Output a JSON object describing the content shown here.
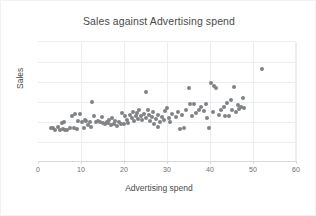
{
  "chart_data": {
    "type": "scatter",
    "title": "Sales against Advertising spend",
    "xlabel": "Advertising spend",
    "ylabel": "Sales",
    "xlim": [
      0,
      60
    ],
    "ylim": [
      0,
      6
    ],
    "xticks": [
      0,
      10,
      20,
      30,
      40,
      50,
      60
    ],
    "yticks": [],
    "grid": true,
    "legend": false,
    "marker_color": "#808285",
    "series": [
      {
        "name": "Sales",
        "points": [
          [
            3.0,
            1.68
          ],
          [
            3.4,
            1.7
          ],
          [
            4.0,
            1.62
          ],
          [
            4.6,
            1.75
          ],
          [
            5.2,
            1.6
          ],
          [
            5.5,
            1.95
          ],
          [
            5.8,
            1.66
          ],
          [
            6.0,
            2.02
          ],
          [
            6.3,
            1.58
          ],
          [
            6.8,
            1.62
          ],
          [
            7.4,
            1.68
          ],
          [
            7.8,
            2.3
          ],
          [
            8.3,
            1.72
          ],
          [
            8.6,
            2.38
          ],
          [
            9.0,
            1.66
          ],
          [
            9.4,
            2.05
          ],
          [
            9.8,
            2.42
          ],
          [
            10.2,
            2.0
          ],
          [
            10.6,
            1.7
          ],
          [
            10.9,
            2.12
          ],
          [
            11.2,
            2.06
          ],
          [
            11.6,
            1.84
          ],
          [
            12.0,
            2.02
          ],
          [
            12.3,
            1.74
          ],
          [
            12.6,
            3.02
          ],
          [
            13.0,
            2.3
          ],
          [
            13.4,
            2.0
          ],
          [
            14.0,
            2.06
          ],
          [
            14.4,
            1.98
          ],
          [
            14.8,
            2.24
          ],
          [
            15.2,
            1.96
          ],
          [
            15.6,
            1.88
          ],
          [
            16.0,
            2.02
          ],
          [
            16.3,
            1.94
          ],
          [
            16.6,
            2.08
          ],
          [
            17.0,
            1.86
          ],
          [
            17.3,
            2.22
          ],
          [
            17.6,
            1.9
          ],
          [
            18.0,
            2.04
          ],
          [
            18.4,
            1.82
          ],
          [
            18.8,
            2.0
          ],
          [
            19.2,
            1.92
          ],
          [
            19.6,
            2.46
          ],
          [
            20.0,
            1.88
          ],
          [
            20.3,
            2.3
          ],
          [
            20.6,
            2.1
          ],
          [
            21.0,
            1.96
          ],
          [
            21.4,
            2.34
          ],
          [
            21.8,
            2.18
          ],
          [
            22.0,
            2.5
          ],
          [
            22.4,
            2.06
          ],
          [
            22.8,
            2.28
          ],
          [
            23.0,
            2.44
          ],
          [
            23.3,
            2.16
          ],
          [
            23.6,
            2.58
          ],
          [
            24.0,
            2.3
          ],
          [
            24.3,
            2.12
          ],
          [
            24.6,
            2.4
          ],
          [
            25.0,
            3.52
          ],
          [
            25.2,
            2.2
          ],
          [
            25.5,
            2.62
          ],
          [
            25.8,
            2.34
          ],
          [
            26.0,
            2.06
          ],
          [
            26.4,
            2.26
          ],
          [
            26.8,
            2.48
          ],
          [
            27.0,
            1.92
          ],
          [
            27.4,
            2.14
          ],
          [
            27.8,
            1.74
          ],
          [
            28.0,
            2.36
          ],
          [
            28.4,
            2.02
          ],
          [
            28.8,
            2.26
          ],
          [
            29.2,
            2.08
          ],
          [
            29.6,
            2.54
          ],
          [
            30.0,
            2.68
          ],
          [
            30.4,
            2.2
          ],
          [
            30.8,
            2.02
          ],
          [
            31.2,
            2.4
          ],
          [
            32.0,
            2.24
          ],
          [
            32.6,
            2.5
          ],
          [
            33.0,
            1.66
          ],
          [
            33.4,
            2.34
          ],
          [
            34.0,
            1.7
          ],
          [
            34.4,
            2.62
          ],
          [
            35.0,
            3.72
          ],
          [
            35.4,
            2.88
          ],
          [
            35.8,
            2.3
          ],
          [
            36.2,
            2.9
          ],
          [
            36.8,
            2.44
          ],
          [
            37.4,
            2.62
          ],
          [
            38.0,
            2.74
          ],
          [
            38.6,
            2.56
          ],
          [
            39.0,
            2.88
          ],
          [
            39.4,
            2.18
          ],
          [
            39.8,
            1.7
          ],
          [
            40.2,
            3.96
          ],
          [
            40.6,
            2.52
          ],
          [
            41.0,
            3.78
          ],
          [
            41.4,
            3.72
          ],
          [
            42.0,
            2.34
          ],
          [
            42.6,
            2.6
          ],
          [
            43.2,
            2.74
          ],
          [
            43.6,
            2.3
          ],
          [
            44.0,
            2.96
          ],
          [
            44.4,
            2.28
          ],
          [
            44.8,
            3.08
          ],
          [
            45.2,
            2.6
          ],
          [
            45.6,
            3.76
          ],
          [
            46.0,
            2.48
          ],
          [
            46.4,
            2.86
          ],
          [
            46.8,
            2.66
          ],
          [
            47.2,
            2.74
          ],
          [
            47.6,
            3.2
          ],
          [
            48.0,
            2.72
          ],
          [
            52.2,
            4.64
          ]
        ]
      }
    ]
  },
  "axis": {
    "x_tick_labels": [
      "0",
      "10",
      "20",
      "30",
      "40",
      "50",
      "60"
    ]
  }
}
